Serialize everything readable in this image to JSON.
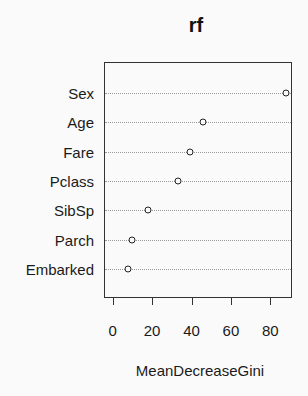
{
  "chart_data": {
    "type": "scatter",
    "subtype": "dotchart",
    "title": "rf",
    "xlabel": "MeanDecreaseGini",
    "ylabel": "",
    "categories": [
      "Sex",
      "Age",
      "Fare",
      "Pclass",
      "SibSp",
      "Parch",
      "Embarked"
    ],
    "values": [
      88,
      46,
      39,
      33,
      18,
      10,
      8
    ],
    "xlim": [
      -4,
      91
    ],
    "xticks": [
      0,
      20,
      40,
      60,
      80
    ],
    "grid": "dotted horizontal lines per category",
    "legend": "none"
  },
  "labels": {
    "title": "rf",
    "xlabel": "MeanDecreaseGini",
    "rows": [
      "Sex",
      "Age",
      "Fare",
      "Pclass",
      "SibSp",
      "Parch",
      "Embarked"
    ],
    "ticks": [
      "0",
      "20",
      "40",
      "60",
      "80"
    ]
  }
}
